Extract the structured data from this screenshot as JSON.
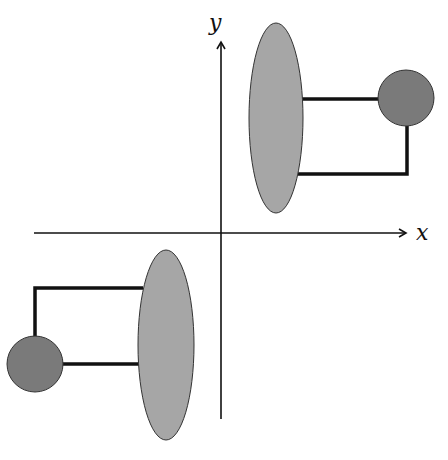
{
  "diagram": {
    "axes": {
      "x_label": "x",
      "y_label": "y"
    },
    "colors": {
      "ellipse_fill": "#a6a6a6",
      "circle_fill": "#7a7a7a",
      "stroke": "#111111"
    },
    "components": [
      {
        "type": "ellipse",
        "quadrant": "top-right",
        "cx": 276,
        "cy": 118,
        "rx": 27,
        "ry": 95
      },
      {
        "type": "circle",
        "quadrant": "top-right",
        "cx": 406,
        "cy": 98,
        "r": 28
      },
      {
        "type": "ellipse",
        "quadrant": "bottom-left",
        "cx": 166,
        "cy": 345,
        "rx": 28,
        "ry": 95
      },
      {
        "type": "circle",
        "quadrant": "bottom-left",
        "cx": 35,
        "cy": 364,
        "r": 28
      }
    ]
  }
}
